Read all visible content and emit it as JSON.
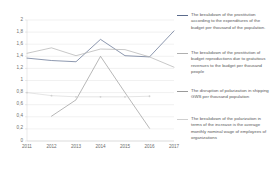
{
  "chart_data": {
    "type": "line",
    "title": "",
    "xlabel": "",
    "ylabel": "",
    "categories": [
      "2011",
      "2012",
      "2013",
      "2014",
      "2015",
      "2016",
      "2017"
    ],
    "ylim": [
      0,
      2
    ],
    "yticks": [
      "0",
      "0,2",
      "0,4",
      "0,6",
      "0,8",
      "1",
      "1,2",
      "1,4",
      "1,6",
      "1,8",
      "2"
    ],
    "ytick_values": [
      0,
      0.2,
      0.4,
      0.6,
      0.8,
      1.0,
      1.2,
      1.4,
      1.6,
      1.8,
      2.0
    ],
    "grid": true,
    "legend_position": "right",
    "series": [
      {
        "name": "The breakdown of the prostitution according to the expenditures of the budget per thousand of the population.",
        "color": "#5b6b8c",
        "values": [
          1.37,
          1.33,
          1.31,
          1.68,
          1.41,
          1.39,
          1.82
        ]
      },
      {
        "name": "The breakdown of the prostitution of budget reproductions due to gratuitous revenues to the budget per thousand people",
        "color": "#b0b0b0",
        "values": [
          1.45,
          1.54,
          1.41,
          1.52,
          1.51,
          1.39,
          1.22
        ]
      },
      {
        "name": "The disruption of polarization in shipping GWS per thousand population",
        "color": "#9a9a9a",
        "values": [
          null,
          0.41,
          0.68,
          1.4,
          0.8,
          0.21,
          null
        ]
      },
      {
        "name": "The breakdown of the polarization in terms of the increase is the average monthly nominal wage of employees of organizations",
        "color": "#cfcfcf",
        "values": [
          0.8,
          0.75,
          0.73,
          0.73,
          0.73,
          0.74,
          null
        ]
      }
    ]
  },
  "axes": {
    "y_tick_labels": [
      "2",
      "1,8",
      "1,6",
      "1,4",
      "1,2",
      "1",
      "0,8",
      "0,6",
      "0,4",
      "0,2",
      "0"
    ],
    "x_tick_labels": [
      "2011",
      "2012",
      "2013",
      "2014",
      "2015",
      "2016",
      "2017"
    ]
  },
  "legend": {
    "entries": [
      {
        "label": "The breakdown of the prostitution according to the expenditures of the budget per thousand of the population.",
        "color": "#5b6b8c"
      },
      {
        "label": "The breakdown of the prostitution of budget reproductions due to gratuitous revenues to the budget per thousand people",
        "color": "#b0b0b0"
      },
      {
        "label": "The disruption of polarization in shipping GWS per thousand population",
        "color": "#9a9a9a"
      },
      {
        "label": "The breakdown of the polarization in terms of the increase is the average monthly nominal wage of employees of organizations",
        "color": "#cfcfcf"
      }
    ]
  },
  "colors": {
    "grid": "#dcdcdc",
    "axis": "#c9c9c9",
    "tick_text": "#6d6d6d",
    "legend_text": "#585858",
    "background": "#ffffff"
  }
}
